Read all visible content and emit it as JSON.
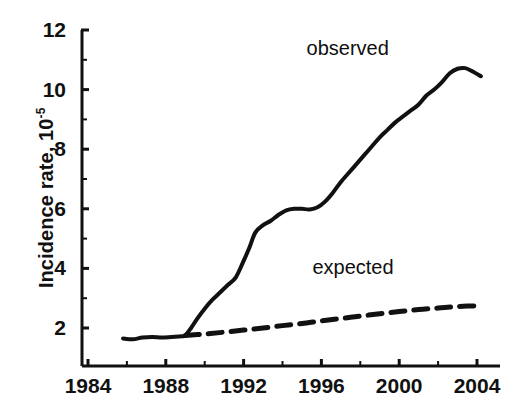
{
  "chart_data": {
    "type": "line",
    "title": "",
    "subtitle": "",
    "xlabel": "",
    "ylabel": "Incidence rate, 10",
    "ylabel_exponent": "-5",
    "xlim": [
      1984,
      2005
    ],
    "ylim": [
      0.8,
      12
    ],
    "grid": false,
    "legend_position": "inline-annotations",
    "x_ticks": [
      "1984",
      "1988",
      "1992",
      "1996",
      "2000",
      "2004"
    ],
    "x_tick_values": [
      1984,
      1988,
      1992,
      1996,
      2000,
      2004
    ],
    "x_minor_tick_values": [
      1986,
      1990,
      1994,
      1998,
      2002
    ],
    "y_ticks": [
      "2",
      "4",
      "6",
      "8",
      "10",
      "12"
    ],
    "y_tick_values": [
      2,
      4,
      6,
      8,
      10,
      12
    ],
    "y_minor_tick_values": [
      3,
      5,
      7,
      9,
      11
    ],
    "series": [
      {
        "name": "observed",
        "style": "solid",
        "color": "#111111",
        "x": [
          1985.8,
          1986.3,
          1986.8,
          1987.3,
          1987.8,
          1988.3,
          1988.8,
          1989.0,
          1989.3,
          1989.6,
          1990.0,
          1990.4,
          1990.8,
          1991.2,
          1991.6,
          1992.0,
          1992.3,
          1992.6,
          1993.0,
          1993.4,
          1993.8,
          1994.2,
          1994.6,
          1995.0,
          1995.4,
          1995.8,
          1996.2,
          1996.6,
          1997.0,
          1997.4,
          1997.8,
          1998.2,
          1998.6,
          1999.0,
          1999.4,
          1999.8,
          2000.2,
          2000.6,
          2001.0,
          2001.4,
          2001.8,
          2002.2,
          2002.6,
          2003.0,
          2003.4,
          2003.8,
          2004.2
        ],
        "y": [
          1.65,
          1.62,
          1.68,
          1.7,
          1.68,
          1.7,
          1.72,
          1.75,
          2.0,
          2.3,
          2.65,
          2.95,
          3.2,
          3.45,
          3.7,
          4.25,
          4.7,
          5.2,
          5.45,
          5.6,
          5.8,
          5.95,
          6.0,
          6.0,
          5.98,
          6.05,
          6.25,
          6.55,
          6.9,
          7.2,
          7.5,
          7.8,
          8.1,
          8.4,
          8.65,
          8.9,
          9.1,
          9.3,
          9.5,
          9.8,
          10.0,
          10.25,
          10.55,
          10.7,
          10.72,
          10.6,
          10.45
        ]
      },
      {
        "name": "expected",
        "style": "dashed",
        "color": "#111111",
        "x": [
          1989.0,
          1990.0,
          1991.0,
          1992.0,
          1993.0,
          1994.0,
          1995.0,
          1996.0,
          1997.0,
          1998.0,
          1999.0,
          2000.0,
          2001.0,
          2002.0,
          2003.0,
          2004.2
        ],
        "y": [
          1.75,
          1.8,
          1.86,
          1.93,
          2.0,
          2.08,
          2.15,
          2.24,
          2.32,
          2.4,
          2.48,
          2.55,
          2.62,
          2.67,
          2.72,
          2.75
        ]
      }
    ],
    "annotations": [
      {
        "text": "observed",
        "x": 1997.5,
        "y": 11.4
      },
      {
        "text": "expected",
        "x": 1997.8,
        "y": 4.05
      }
    ]
  },
  "axis_label": {
    "y_text": "Incidence rate, 10",
    "y_exponent": "-5"
  }
}
